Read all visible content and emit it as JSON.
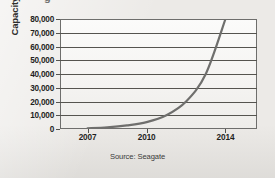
{
  "figure": {
    "cut_off_title_fragment": "g",
    "source_note": "Source: Seagate",
    "background_color": "#eceae7",
    "line_color": "#6f6f6d",
    "grid_color": "#55544f",
    "frame_color": "#6e6e6c"
  },
  "chart_data": {
    "type": "line",
    "title": "",
    "xlabel": "",
    "ylabel": "Capacity in Gigabytes",
    "source": "Source: Seagate",
    "xlim": [
      2005.6,
      2015.6
    ],
    "ylim": [
      0,
      80000
    ],
    "grid": "horizontal",
    "legend": "none",
    "ytick_labels": [
      "0",
      "10,000",
      "20,000",
      "30,000",
      "40,000",
      "50,000",
      "60,000",
      "70,000",
      "80,000"
    ],
    "ytick_values": [
      0,
      10000,
      20000,
      30000,
      40000,
      50000,
      60000,
      70000,
      80000
    ],
    "xtick_labels": [
      "2007",
      "2010",
      "2014"
    ],
    "xtick_values": [
      2007,
      2010,
      2014
    ],
    "series": [
      {
        "name": "Hard drive capacity",
        "x": [
          2007,
          2008,
          2009,
          2010,
          2011,
          2012,
          2013,
          2014
        ],
        "values": [
          500,
          1200,
          2600,
          5000,
          10000,
          20000,
          40000,
          80000
        ]
      }
    ],
    "annotations": []
  }
}
